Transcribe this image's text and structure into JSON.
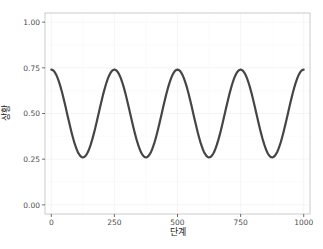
{
  "chart_data": {
    "type": "line",
    "title": "",
    "xlabel": "단계",
    "ylabel": "상황",
    "xlim": [
      -25,
      1025
    ],
    "ylim": [
      -0.05,
      1.05
    ],
    "x_ticks": [
      0,
      250,
      500,
      750,
      1000
    ],
    "x_tick_labels": [
      "0",
      "250",
      "500",
      "750",
      "1000"
    ],
    "y_ticks": [
      0.0,
      0.25,
      0.5,
      0.75,
      1.0
    ],
    "y_tick_labels": [
      "0.00",
      "0.25",
      "0.50",
      "0.75",
      "1.00"
    ],
    "grid": true,
    "legend": "none",
    "series": [
      {
        "name": "상황",
        "color": "#454545",
        "formula": "0.5 + 0.24*cos(2*pi*x/250)",
        "x": [
          0,
          62.5,
          125,
          187.5,
          250,
          312.5,
          375,
          437.5,
          500,
          562.5,
          625,
          687.5,
          750,
          812.5,
          875,
          937.5,
          1000
        ],
        "values": [
          0.74,
          0.5,
          0.26,
          0.5,
          0.74,
          0.5,
          0.26,
          0.5,
          0.74,
          0.5,
          0.26,
          0.5,
          0.74,
          0.5,
          0.26,
          0.5,
          0.74
        ]
      }
    ]
  },
  "style": {
    "line_color": "#454545",
    "grid_color": "#f0f0f0",
    "panel_border": "#bdbdbd"
  }
}
